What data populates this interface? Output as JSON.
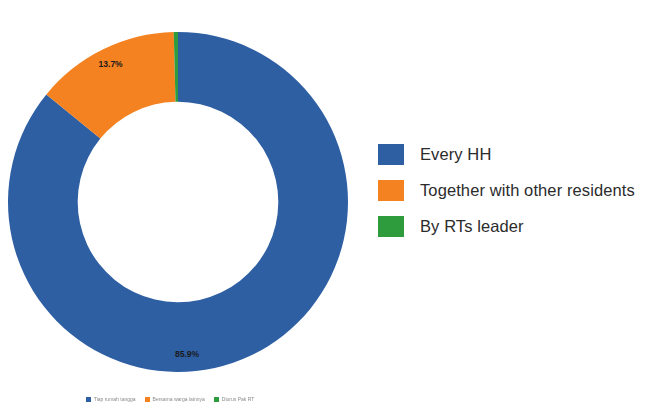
{
  "chart_data": {
    "type": "pie",
    "variant": "donut",
    "title": "",
    "subtitle": "",
    "xlabel": "",
    "ylabel": "",
    "grid": false,
    "legend_position": "right",
    "categories": [
      "Every HH",
      "Together with other residents",
      "By RTs leader"
    ],
    "values": [
      85.9,
      13.7,
      0.4
    ],
    "value_unit": "%",
    "data_labels": [
      "85.9%",
      "13.7%",
      ""
    ],
    "colors": [
      "#2E5FA3",
      "#F58220",
      "#2E9B3C"
    ],
    "start_angle_deg": 0,
    "direction": "clockwise",
    "inner_radius_ratio": 0.59,
    "series": [
      {
        "name": "Share of households",
        "values": [
          85.9,
          13.7,
          0.4
        ]
      }
    ]
  },
  "donut": {
    "labels": {
      "blue_pct": "85.9%",
      "orange_pct": "13.7%",
      "green_pct": ""
    }
  },
  "legend_right": {
    "items": [
      {
        "label": "Every HH",
        "color": "#2E5FA3"
      },
      {
        "label": "Together with other residents",
        "color": "#F58220"
      },
      {
        "label": "By RTs leader",
        "color": "#2E9B3C"
      }
    ]
  },
  "legend_bottom": {
    "items": [
      {
        "label": "Tiap rumah tangga",
        "color": "#2E5FA3"
      },
      {
        "label": "Bersama warga lainnya",
        "color": "#F58220"
      },
      {
        "label": "Diurus Pak RT",
        "color": "#2E9B3C"
      }
    ]
  }
}
